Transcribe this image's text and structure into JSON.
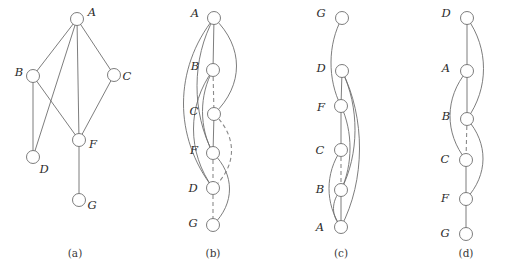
{
  "figure": {
    "background_color": "#ffffff",
    "edge_color": "#6e6e6e",
    "dashed_edge_color": "#8a8a8a",
    "node_fill_color": "#ffffff",
    "width": 516,
    "height": 276
  },
  "panels": [
    {
      "id": "a",
      "caption": "(a)",
      "caption_pos": {
        "x": 75,
        "y": 253
      },
      "kind": "graph-drawing",
      "nodes": [
        {
          "id": "A",
          "label": "A",
          "x": 77,
          "y": 19,
          "r": 6.5,
          "label_x": 92,
          "label_y": 13
        },
        {
          "id": "B",
          "label": "B",
          "x": 33,
          "y": 76,
          "r": 6.5,
          "label_x": 19,
          "label_y": 73
        },
        {
          "id": "C",
          "label": "C",
          "x": 114,
          "y": 75,
          "r": 6.5,
          "label_x": 127,
          "label_y": 77
        },
        {
          "id": "F",
          "label": "F",
          "x": 79,
          "y": 140,
          "r": 6.5,
          "label_x": 93,
          "label_y": 145
        },
        {
          "id": "D",
          "label": "D",
          "x": 33,
          "y": 157,
          "r": 6.5,
          "label_x": 44,
          "label_y": 170
        },
        {
          "id": "G",
          "label": "G",
          "x": 79,
          "y": 200,
          "r": 6.5,
          "label_x": 92,
          "label_y": 206
        }
      ],
      "edges": [
        {
          "from": "A",
          "to": "B"
        },
        {
          "from": "A",
          "to": "C"
        },
        {
          "from": "A",
          "to": "D"
        },
        {
          "from": "A",
          "to": "F"
        },
        {
          "from": "B",
          "to": "D"
        },
        {
          "from": "B",
          "to": "F"
        },
        {
          "from": "C",
          "to": "F"
        },
        {
          "from": "F",
          "to": "G"
        }
      ]
    },
    {
      "id": "b",
      "caption": "(b)",
      "caption_pos": {
        "x": 213,
        "y": 253
      },
      "kind": "linear-embedding",
      "order": [
        "A",
        "B",
        "C",
        "F",
        "D",
        "G"
      ],
      "spine_x": 214,
      "nodes": [
        {
          "id": "A",
          "label": "A",
          "x": 214,
          "y": 18,
          "r": 6.5,
          "label_x": 195,
          "label_y": 14
        },
        {
          "id": "B",
          "label": "B",
          "x": 213,
          "y": 70,
          "r": 6.5,
          "label_x": 195,
          "label_y": 67
        },
        {
          "id": "C",
          "label": "C",
          "x": 214,
          "y": 114,
          "r": 6.5,
          "label_x": 194,
          "label_y": 112
        },
        {
          "id": "F",
          "label": "F",
          "x": 213,
          "y": 153,
          "r": 6.5,
          "label_x": 194,
          "label_y": 151
        },
        {
          "id": "D",
          "label": "D",
          "x": 213,
          "y": 188,
          "r": 6.5,
          "label_x": 193,
          "label_y": 189
        },
        {
          "id": "G",
          "label": "G",
          "x": 213,
          "y": 225,
          "r": 6.5,
          "label_x": 193,
          "label_y": 224
        }
      ],
      "edges": [
        {
          "from": "A",
          "to": "B",
          "side": "spine",
          "style": "solid"
        },
        {
          "from": "A",
          "to": "D",
          "side": "left",
          "style": "solid",
          "bow": 40
        },
        {
          "from": "A",
          "to": "C",
          "side": "right",
          "style": "solid",
          "bow": 30
        },
        {
          "from": "A",
          "to": "F",
          "side": "left",
          "style": "solid",
          "bow": 22
        },
        {
          "from": "B",
          "to": "C",
          "side": "spine",
          "style": "dashed"
        },
        {
          "from": "B",
          "to": "D",
          "side": "left",
          "style": "solid",
          "bow": 26
        },
        {
          "from": "B",
          "to": "F",
          "side": "left",
          "style": "solid",
          "bow": 14
        },
        {
          "from": "C",
          "to": "F",
          "side": "spine",
          "style": "solid"
        },
        {
          "from": "C",
          "to": "D",
          "side": "right",
          "style": "dashed",
          "bow": 24
        },
        {
          "from": "F",
          "to": "D",
          "side": "spine",
          "style": "dashed"
        },
        {
          "from": "F",
          "to": "G",
          "side": "right",
          "style": "solid",
          "bow": 22
        },
        {
          "from": "D",
          "to": "G",
          "side": "spine",
          "style": "dashed"
        }
      ]
    },
    {
      "id": "c",
      "caption": "(c)",
      "caption_pos": {
        "x": 341,
        "y": 253
      },
      "kind": "linear-embedding",
      "order": [
        "G",
        "D",
        "F",
        "C",
        "B",
        "A"
      ],
      "spine_x": 341,
      "nodes": [
        {
          "id": "G",
          "label": "G",
          "x": 342,
          "y": 18,
          "r": 6.5,
          "label_x": 321,
          "label_y": 14
        },
        {
          "id": "D",
          "label": "D",
          "x": 342,
          "y": 71,
          "r": 6.5,
          "label_x": 321,
          "label_y": 69
        },
        {
          "id": "F",
          "label": "F",
          "x": 341,
          "y": 106,
          "r": 6.5,
          "label_x": 321,
          "label_y": 108
        },
        {
          "id": "C",
          "label": "C",
          "x": 341,
          "y": 150,
          "r": 6.5,
          "label_x": 320,
          "label_y": 151
        },
        {
          "id": "B",
          "label": "B",
          "x": 341,
          "y": 190,
          "r": 6.5,
          "label_x": 320,
          "label_y": 190
        },
        {
          "id": "A",
          "label": "A",
          "x": 341,
          "y": 227,
          "r": 6.5,
          "label_x": 320,
          "label_y": 228
        }
      ],
      "edges": [
        {
          "from": "G",
          "to": "F",
          "side": "left",
          "style": "solid",
          "bow": 14
        },
        {
          "from": "D",
          "to": "F",
          "side": "spine",
          "style": "solid"
        },
        {
          "from": "D",
          "to": "B",
          "side": "right",
          "style": "solid",
          "bow": 18
        },
        {
          "from": "D",
          "to": "A",
          "side": "right",
          "style": "solid",
          "bow": 24
        },
        {
          "from": "F",
          "to": "C",
          "side": "spine",
          "style": "solid"
        },
        {
          "from": "F",
          "to": "B",
          "side": "right",
          "style": "solid",
          "bow": 12
        },
        {
          "from": "C",
          "to": "B",
          "side": "spine",
          "style": "dashed"
        },
        {
          "from": "C",
          "to": "A",
          "side": "left",
          "style": "solid",
          "bow": 16
        },
        {
          "from": "B",
          "to": "A",
          "side": "spine",
          "style": "solid"
        },
        {
          "from": "B",
          "to": "A",
          "side": "left",
          "style": "solid",
          "bow": 10
        }
      ]
    },
    {
      "id": "d",
      "caption": "(d)",
      "caption_pos": {
        "x": 466,
        "y": 253
      },
      "kind": "linear-embedding",
      "order": [
        "D",
        "A",
        "B",
        "C",
        "F",
        "G"
      ],
      "spine_x": 467,
      "nodes": [
        {
          "id": "D",
          "label": "D",
          "x": 467,
          "y": 18,
          "r": 6.5,
          "label_x": 446,
          "label_y": 14
        },
        {
          "id": "A",
          "label": "A",
          "x": 467,
          "y": 71,
          "r": 6.5,
          "label_x": 446,
          "label_y": 69
        },
        {
          "id": "B",
          "label": "B",
          "x": 467,
          "y": 119,
          "r": 6.5,
          "label_x": 446,
          "label_y": 117
        },
        {
          "id": "C",
          "label": "C",
          "x": 466,
          "y": 160,
          "r": 6.5,
          "label_x": 445,
          "label_y": 160
        },
        {
          "id": "F",
          "label": "F",
          "x": 466,
          "y": 199,
          "r": 6.5,
          "label_x": 445,
          "label_y": 199
        },
        {
          "id": "G",
          "label": "G",
          "x": 466,
          "y": 234,
          "r": 6.5,
          "label_x": 445,
          "label_y": 234
        }
      ],
      "edges": [
        {
          "from": "D",
          "to": "A",
          "side": "spine",
          "style": "solid"
        },
        {
          "from": "D",
          "to": "B",
          "side": "right",
          "style": "solid",
          "bow": 22
        },
        {
          "from": "A",
          "to": "B",
          "side": "spine",
          "style": "solid"
        },
        {
          "from": "A",
          "to": "C",
          "side": "left",
          "style": "solid",
          "bow": 22
        },
        {
          "from": "B",
          "to": "C",
          "side": "spine",
          "style": "dashed"
        },
        {
          "from": "B",
          "to": "F",
          "side": "right",
          "style": "solid",
          "bow": 22
        },
        {
          "from": "C",
          "to": "F",
          "side": "spine",
          "style": "solid"
        },
        {
          "from": "F",
          "to": "G",
          "side": "spine",
          "style": "solid"
        }
      ]
    }
  ]
}
